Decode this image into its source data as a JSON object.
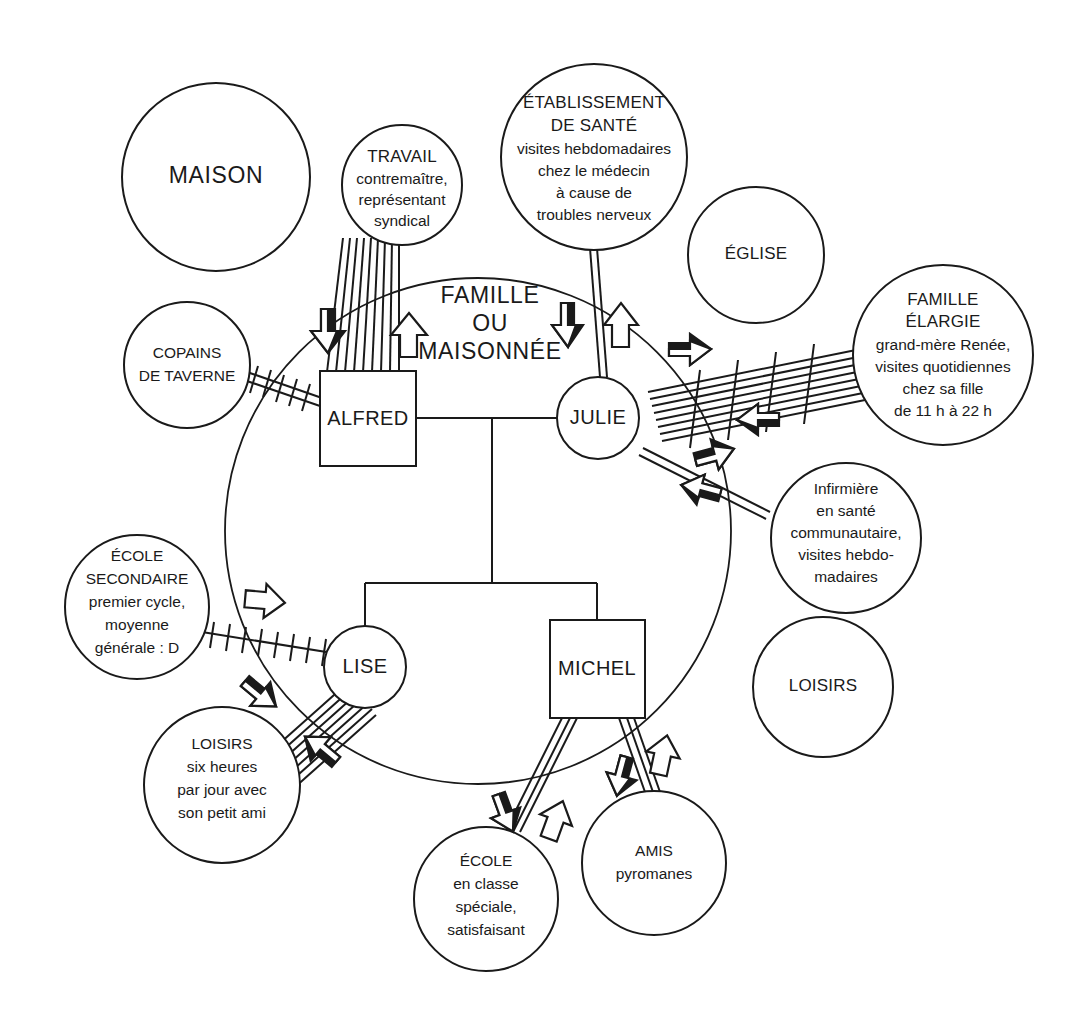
{
  "diagram": {
    "type": "ecomap",
    "language": "fr",
    "center": {
      "title_lines": [
        "FAMILLE",
        "OU",
        "MAISONNÉE"
      ],
      "members": [
        {
          "id": "alfred",
          "name": "ALFRED",
          "shape": "square",
          "role": "father"
        },
        {
          "id": "julie",
          "name": "JULIE",
          "shape": "circle",
          "role": "mother"
        },
        {
          "id": "lise",
          "name": "LISE",
          "shape": "circle",
          "role": "daughter"
        },
        {
          "id": "michel",
          "name": "MICHEL",
          "shape": "square",
          "role": "son"
        }
      ]
    },
    "external_systems": [
      {
        "id": "maison",
        "lines": [
          "MAISON"
        ],
        "style": "caps-only",
        "connected": false
      },
      {
        "id": "travail",
        "lines": [
          "TRAVAIL",
          "contremaître,",
          "représentant",
          "syndical"
        ],
        "caps_count": 1,
        "connected": true
      },
      {
        "id": "etablissement-sante",
        "lines": [
          "ÉTABLISSEMENT",
          "DE SANTÉ",
          "visites hebdomadaires",
          "chez le médecin",
          "à cause de",
          "troubles nerveux"
        ],
        "caps_count": 2,
        "connected": true
      },
      {
        "id": "eglise",
        "lines": [
          "ÉGLISE"
        ],
        "style": "caps-only",
        "connected": false
      },
      {
        "id": "famille-elargie",
        "lines": [
          "FAMILLE",
          "ÉLARGIE",
          "grand-mère Renée,",
          "visites quotidiennes",
          "chez sa fille",
          "de 11 h à 22 h"
        ],
        "caps_count": 2,
        "connected": true
      },
      {
        "id": "copains-taverne",
        "lines": [
          "COPAINS",
          "DE TAVERNE"
        ],
        "style": "caps-only",
        "connected": true
      },
      {
        "id": "infirmiere",
        "lines": [
          "Infirmière",
          "en santé",
          "communautaire,",
          "visites hebdo-",
          "madaires"
        ],
        "caps_count": 0,
        "connected": true
      },
      {
        "id": "ecole-secondaire",
        "lines": [
          "ÉCOLE",
          "SECONDAIRE",
          "premier cycle,",
          "moyenne",
          "générale : D"
        ],
        "caps_count": 2,
        "connected": true
      },
      {
        "id": "loisirs-lise",
        "lines": [
          "LOISIRS",
          "six heures",
          "par jour avec",
          "son petit ami"
        ],
        "caps_count": 1,
        "connected": true
      },
      {
        "id": "loisirs-vide",
        "lines": [
          "LOISIRS"
        ],
        "style": "caps-only",
        "connected": false
      },
      {
        "id": "ecole-michel",
        "lines": [
          "ÉCOLE",
          "en classe",
          "spéciale,",
          "satisfaisant"
        ],
        "caps_count": 1,
        "connected": true
      },
      {
        "id": "amis-pyromanes",
        "lines": [
          "AMIS",
          "pyromanes"
        ],
        "caps_count": 1,
        "connected": true
      }
    ],
    "connections": [
      {
        "from": "alfred",
        "to": "travail",
        "strength": "very-strong",
        "quality": "normal",
        "flow": "bidirectional"
      },
      {
        "from": "alfred",
        "to": "copains-taverne",
        "strength": "moderate",
        "quality": "stressful",
        "flow": "none"
      },
      {
        "from": "julie",
        "to": "etablissement-sante",
        "strength": "moderate",
        "quality": "normal",
        "flow": "bidirectional"
      },
      {
        "from": "julie",
        "to": "famille-elargie",
        "strength": "very-strong",
        "quality": "stressful",
        "flow": "bidirectional"
      },
      {
        "from": "julie",
        "to": "infirmiere",
        "strength": "moderate",
        "quality": "normal",
        "flow": "bidirectional"
      },
      {
        "from": "lise",
        "to": "ecole-secondaire",
        "strength": "weak",
        "quality": "stressful",
        "flow": "outgoing"
      },
      {
        "from": "lise",
        "to": "loisirs-lise",
        "strength": "very-strong",
        "quality": "normal",
        "flow": "bidirectional"
      },
      {
        "from": "michel",
        "to": "ecole-michel",
        "strength": "moderate",
        "quality": "normal",
        "flow": "bidirectional"
      },
      {
        "from": "michel",
        "to": "amis-pyromanes",
        "strength": "moderate",
        "quality": "normal",
        "flow": "bidirectional"
      }
    ],
    "colors": {
      "ink": "#1a1a1a",
      "paper": "#ffffff"
    }
  }
}
